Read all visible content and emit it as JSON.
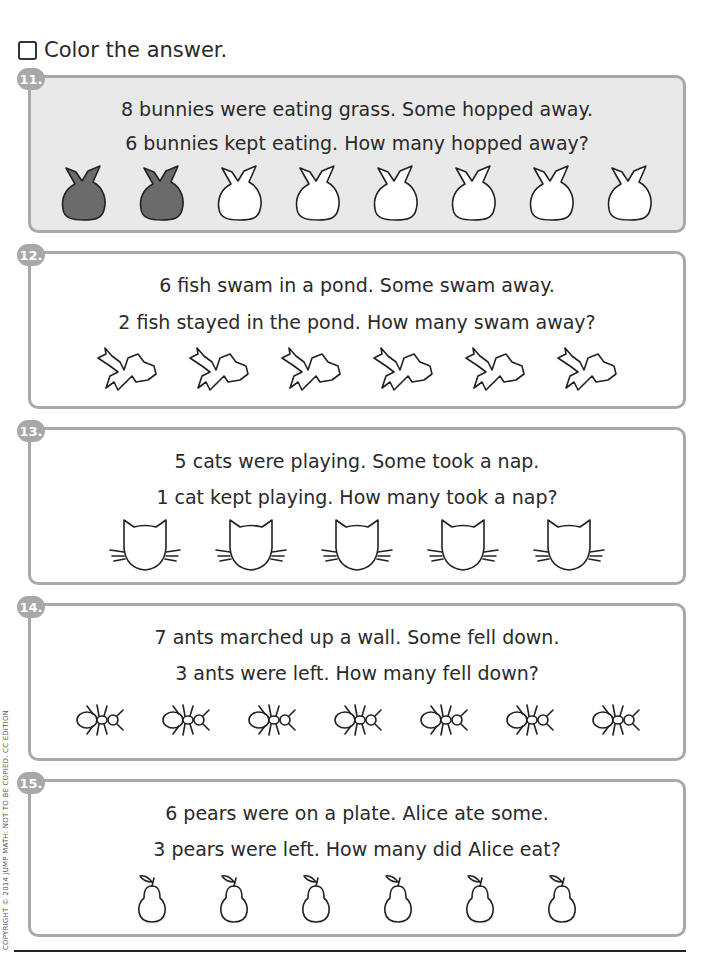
{
  "instruction": {
    "checkbox_icon": "empty-checkbox-icon",
    "text": "Color the answer."
  },
  "problems": [
    {
      "number": "11.",
      "line1": "8 bunnies were eating grass. Some hopped away.",
      "line2": "6 bunnies kept eating. How many hopped away?",
      "picture": "bunny-icon",
      "count": 8,
      "colored": 2,
      "shaded_background": true
    },
    {
      "number": "12.",
      "line1": "6 fish swam in a pond. Some swam away.",
      "line2": "2 fish stayed in the pond. How many swam away?",
      "picture": "fish-icon",
      "count": 6,
      "colored": 0
    },
    {
      "number": "13.",
      "line1": "5 cats were playing. Some took a nap.",
      "line2": "1 cat kept playing. How many took a nap?",
      "picture": "cat-icon",
      "count": 5,
      "colored": 0
    },
    {
      "number": "14.",
      "line1": "7 ants marched up a wall. Some fell down.",
      "line2": "3 ants were left. How many fell down?",
      "picture": "ant-icon",
      "count": 7,
      "colored": 0
    },
    {
      "number": "15.",
      "line1": "6 pears were on a plate. Alice ate some.",
      "line2": "3 pears were left. How many did Alice eat?",
      "picture": "pear-icon",
      "count": 6,
      "colored": 0
    }
  ],
  "footer": {
    "copyright": "COPYRIGHT © 2014 JUMP MATH: NOT TO BE COPIED. CC EDITION"
  },
  "colors": {
    "border": "#a9a9a9",
    "badge": "#a8a8a8",
    "shaded": "#e9e9e9",
    "colored_fill": "#6b6b6b"
  }
}
